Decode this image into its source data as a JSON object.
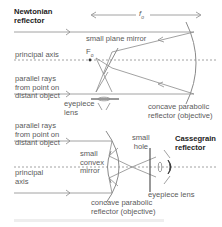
{
  "newtonian": {
    "title_line1": "Newtonian",
    "title_line2": "reflector",
    "focal_length": "f",
    "focal_length_sub": "o",
    "small_plane_mirror": "small plane mirror",
    "principal_axis": "principal axis",
    "focal_point": "F",
    "focal_point_sub": "o",
    "parallel_rays_line1": "parallel rays",
    "parallel_rays_line2": "from point on",
    "parallel_rays_line3": "distant object",
    "eyepiece_line1": "eyepiece",
    "eyepiece_line2": "lens",
    "objective_line1": "concave parabolic",
    "objective_line2": "reflector (objective)"
  },
  "cassegrain": {
    "title_line1": "Cassegrain",
    "title_line2": "reflector",
    "parallel_rays_line1": "parallel rays",
    "parallel_rays_line2": "from point on",
    "parallel_rays_line3": "distant object",
    "convex_mirror_line1": "small",
    "convex_mirror_line2": "convex",
    "convex_mirror_line3": "mirror",
    "principal_axis_line1": "principal",
    "principal_axis_line2": "axis",
    "hole_line1": "small",
    "hole_line2": "hole",
    "eyepiece": "eyepiece lens",
    "objective_line1": "concave parabolic",
    "objective_line2": "reflector (objective)"
  },
  "colors": {
    "line": "#7a7a7a",
    "text": "#5a5a5a",
    "title": "#222222"
  }
}
